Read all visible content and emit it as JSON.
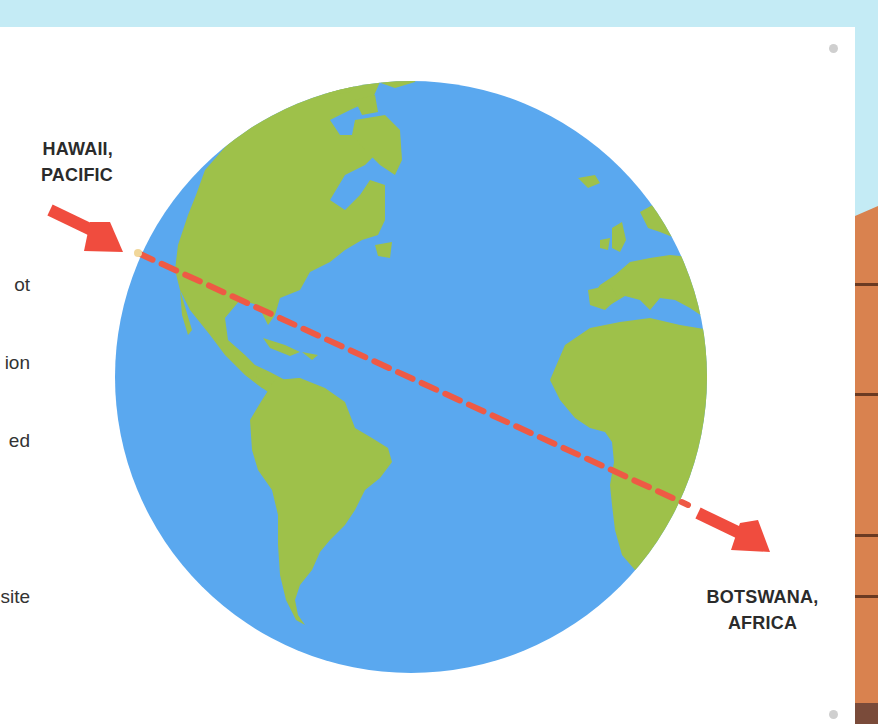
{
  "labels": {
    "origin": {
      "line1": "HAWAII,",
      "line2": "PACIFIC"
    },
    "antipode": {
      "line1": "BOTSWANA,",
      "line2": "AFRICA"
    }
  },
  "body_text_fragments": [
    "ot",
    "ion",
    "ed",
    "",
    "site"
  ],
  "illustration": {
    "subject": "globe showing Americas, Europe and Africa",
    "path": "dashed line through Earth from Hawaii to Botswana",
    "colors": {
      "ocean": "#5aa8ef",
      "land": "#9ec14a",
      "arrow": "#f04c3e",
      "dashed_line": "#ee5a45",
      "sky": "#c4ebf5",
      "brick": "#d9824f",
      "brick_line": "#6b3a22",
      "brick_base": "#7a4b3a",
      "page": "#ffffff"
    }
  }
}
